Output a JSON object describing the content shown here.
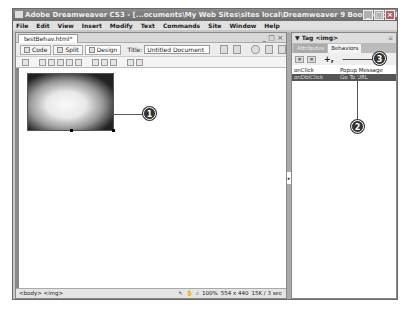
{
  "window": {
    "title": "Adobe Dreamweaver CS3 - [...ocuments\\My Web Sites\\sites local\\Dreamweaver 9 Book\\testBehav.html (XHTML)*]",
    "buttons": [
      "_",
      "□",
      "×"
    ]
  },
  "menu": [
    "File",
    "Edit",
    "View",
    "Insert",
    "Modify",
    "Text",
    "Commands",
    "Site",
    "Window",
    "Help"
  ],
  "document": {
    "tab_label": "testBehav.html*",
    "tab_controls": "_ □ ×",
    "views": {
      "code": "Code",
      "split": "Split",
      "design": "Design"
    },
    "title_label": "Title:",
    "title_value": "Untitled Document",
    "image": {
      "alt": "white kitten photo",
      "selected": true
    }
  },
  "statusbar": {
    "tag_selector": "<body> <img>",
    "zoom": "100%",
    "dimensions": "554 x 440",
    "size_time": "15K / 3 sec"
  },
  "panel": {
    "title": "▼ Tag <img>",
    "options_icon": "≡",
    "tabs": [
      "Attributes",
      "Behaviors"
    ],
    "active_tab": "Behaviors",
    "add_behavior": "+,",
    "remove_behavior": "−",
    "rows": [
      {
        "event": "onClick",
        "action": "Popup Message",
        "selected": false
      },
      {
        "event": "onDblClick",
        "action": "Go To URL",
        "selected": true
      }
    ]
  },
  "callouts": [
    "1",
    "2",
    "3"
  ]
}
